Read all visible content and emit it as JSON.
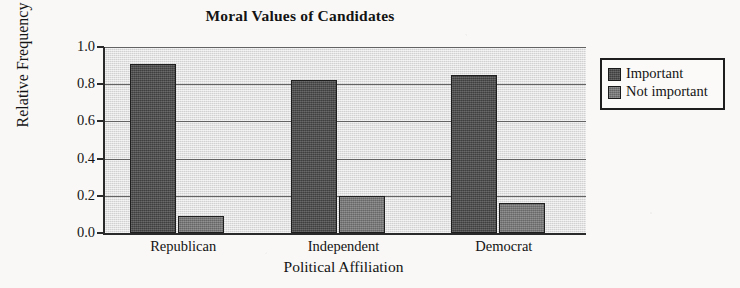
{
  "chart_data": {
    "type": "bar",
    "title": "Moral Values of Candidates",
    "xlabel": "Political Affiliation",
    "ylabel": "Relative Frequency",
    "categories": [
      "Republican",
      "Independent",
      "Democrat"
    ],
    "series": [
      {
        "name": "Important",
        "values": [
          0.91,
          0.82,
          0.85
        ],
        "color": "#4b4b4b"
      },
      {
        "name": "Not important",
        "values": [
          0.09,
          0.2,
          0.16
        ],
        "color": "#7b7b7b"
      }
    ],
    "ylim": [
      0.0,
      1.0
    ],
    "ytick_labels": [
      "0.0",
      "0.2",
      "0.4",
      "0.6",
      "0.8",
      "1.0"
    ],
    "ytick_values": [
      0.0,
      0.2,
      0.4,
      0.6,
      0.8,
      1.0
    ],
    "grid": true,
    "legend_position": "right",
    "plot_background": "#d9d9d9",
    "axis_color": "#2a2a2a"
  },
  "legend": {
    "entries": [
      {
        "label": "Important"
      },
      {
        "label": "Not important"
      }
    ]
  }
}
